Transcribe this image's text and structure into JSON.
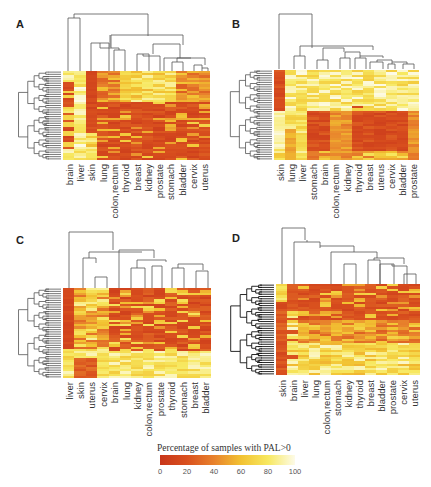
{
  "chart_data": [
    {
      "type": "heatmap",
      "panel": "A",
      "columns": [
        "brain",
        "liver",
        "skin",
        "lung",
        "colon,rectum",
        "thyroid",
        "breast",
        "kidney",
        "prostate",
        "stomach",
        "bladder",
        "cervix",
        "uterus"
      ],
      "rows": 40,
      "value_range": [
        0,
        100
      ],
      "colormap": "heat (red=0, white=100)",
      "row_dendrogram": true,
      "col_dendrogram": true
    },
    {
      "type": "heatmap",
      "panel": "B",
      "columns": [
        "skin",
        "lung",
        "liver",
        "stomach",
        "brain",
        "colon,rectum",
        "kidney",
        "thyroid",
        "breast",
        "uterus",
        "cervix",
        "bladder",
        "prostate"
      ],
      "rows": 40,
      "value_range": [
        0,
        100
      ],
      "colormap": "heat (red=0, white=100)",
      "row_dendrogram": true,
      "col_dendrogram": true
    },
    {
      "type": "heatmap",
      "panel": "C",
      "columns": [
        "liver",
        "skin",
        "uterus",
        "cervix",
        "brain",
        "lung",
        "kidney",
        "colon,rectum",
        "prostate",
        "thyroid",
        "stomach",
        "breast",
        "bladder"
      ],
      "rows": 40,
      "value_range": [
        0,
        100
      ],
      "colormap": "heat (red=0, white=100)",
      "row_dendrogram": true,
      "col_dendrogram": true
    },
    {
      "type": "heatmap",
      "panel": "D",
      "columns": [
        "skin",
        "brain",
        "liver",
        "lung",
        "colon,rectum",
        "stomach",
        "kidney",
        "thyroid",
        "breast",
        "bladder",
        "prostate",
        "cervix",
        "uterus"
      ],
      "rows": 40,
      "value_range": [
        0,
        100
      ],
      "colormap": "heat (red=0, white=100)",
      "row_dendrogram": true,
      "col_dendrogram": true
    }
  ],
  "legend": {
    "title": "Percentage of samples with PAL>0",
    "ticks": [
      "0",
      "20",
      "40",
      "60",
      "80",
      "100"
    ],
    "range": [
      0,
      100
    ]
  },
  "panels": {
    "A": {
      "letter": "A"
    },
    "B": {
      "letter": "B"
    },
    "C": {
      "letter": "C"
    },
    "D": {
      "letter": "D"
    }
  }
}
